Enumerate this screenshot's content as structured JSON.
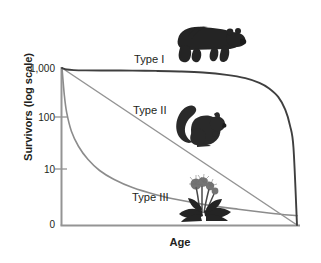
{
  "chart_data": {
    "type": "line",
    "title": "",
    "xlabel": "Age",
    "ylabel": "Survivors (log scale)",
    "y_scale": "log",
    "y_tick_labels": [
      "1,000",
      "100",
      "10",
      "0"
    ],
    "y_tick_values": [
      1000,
      100,
      10,
      0
    ],
    "x_tick_labels": [],
    "grid": false,
    "legend_position": "inline-annotations",
    "xlim": [
      0,
      100
    ],
    "ylim": [
      0,
      1000
    ],
    "series": [
      {
        "name": "Type I",
        "label": "Type I",
        "color": "#3f3f3f",
        "organism": "bear",
        "description": "High survivorship through early and middle life, steep decline in old age",
        "x": [
          0,
          2,
          5,
          10,
          20,
          30,
          40,
          50,
          60,
          70,
          78,
          84,
          88,
          92,
          95,
          97,
          98.5,
          100
        ],
        "y": [
          1000,
          935,
          910,
          900,
          895,
          890,
          880,
          860,
          820,
          740,
          640,
          520,
          410,
          280,
          160,
          80,
          30,
          0
        ]
      },
      {
        "name": "Type II",
        "label": "Type II",
        "color": "#949494",
        "organism": "squirrel",
        "description": "Constant rate of mortality throughout life; straight line on log scale",
        "x": [
          0,
          10,
          20,
          30,
          40,
          50,
          60,
          70,
          80,
          90,
          100
        ],
        "y": [
          1000,
          630,
          400,
          250,
          158,
          100,
          63,
          40,
          25,
          16,
          0
        ]
      },
      {
        "name": "Type III",
        "label": "Type III",
        "color": "#8c8c8c",
        "organism": "dandelion",
        "description": "Very high mortality early in life, then high survivorship for the few remaining",
        "x": [
          0,
          1,
          2,
          4,
          7,
          11,
          16,
          22,
          30,
          40,
          50,
          62,
          75,
          88,
          100
        ],
        "y": [
          1000,
          300,
          140,
          62,
          32,
          18,
          11,
          7.5,
          5.2,
          3.8,
          3.0,
          2.4,
          2.0,
          1.7,
          1.5
        ]
      }
    ]
  },
  "axes": {
    "y_title": "Survivors (log scale)",
    "x_title": "Age",
    "ticks": {
      "t1000": "1,000",
      "t100": "100",
      "t10": "10",
      "t0": "0"
    },
    "axis_color": "#949494"
  },
  "annotations": {
    "type1": "Type I",
    "type2": "Type II",
    "type3": "Type III"
  },
  "organisms": {
    "bear": "bear-illustration",
    "squirrel": "squirrel-illustration",
    "plant": "dandelion-plant-illustration"
  }
}
